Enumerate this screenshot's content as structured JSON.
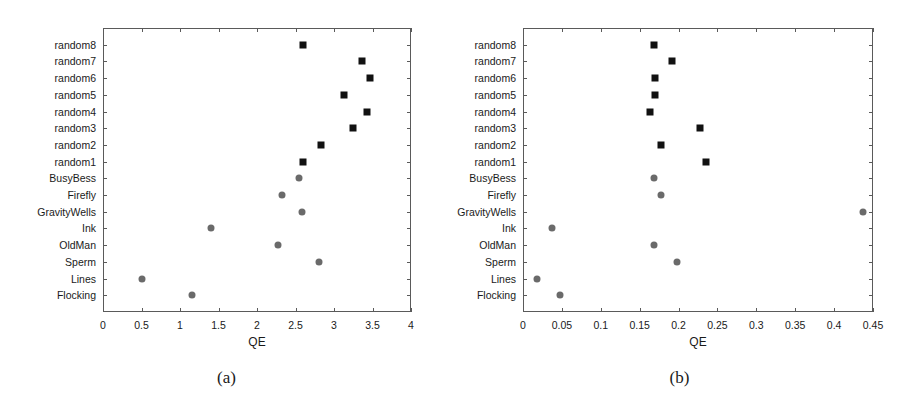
{
  "figure": {
    "panels": [
      {
        "id": "a",
        "caption": "(a)",
        "chart_data": {
          "type": "scatter",
          "title": "",
          "xlabel": "QE",
          "ylabel": "",
          "xlim": [
            0,
            4
          ],
          "xticks": [
            0,
            0.5,
            1,
            1.5,
            2,
            2.5,
            3,
            3.5,
            4
          ],
          "xtick_labels": [
            "0",
            "0.5",
            "1",
            "1.5",
            "2",
            "2.5",
            "3",
            "3.5",
            "4"
          ],
          "grid": false,
          "legend_position": "none",
          "categories": [
            "random8",
            "random7",
            "random6",
            "random5",
            "random4",
            "random3",
            "random2",
            "random1",
            "BusyBess",
            "Firefly",
            "GravityWells",
            "Ink",
            "OldMan",
            "Sperm",
            "Lines",
            "Flocking"
          ],
          "series": [
            {
              "name": "random",
              "marker": "square",
              "color": "#111111",
              "points": [
                {
                  "category": "random8",
                  "value": 2.6
                },
                {
                  "category": "random7",
                  "value": 3.37
                },
                {
                  "category": "random6",
                  "value": 3.47
                },
                {
                  "category": "random5",
                  "value": 3.13
                },
                {
                  "category": "random4",
                  "value": 3.43
                },
                {
                  "category": "random3",
                  "value": 3.25
                },
                {
                  "category": "random2",
                  "value": 2.83
                },
                {
                  "category": "random1",
                  "value": 2.6
                }
              ]
            },
            {
              "name": "named",
              "marker": "circle",
              "color": "#6a6a6a",
              "points": [
                {
                  "category": "BusyBess",
                  "value": 2.55
                },
                {
                  "category": "Firefly",
                  "value": 2.33
                },
                {
                  "category": "GravityWells",
                  "value": 2.58
                },
                {
                  "category": "Ink",
                  "value": 1.4
                },
                {
                  "category": "OldMan",
                  "value": 2.27
                },
                {
                  "category": "Sperm",
                  "value": 2.8
                },
                {
                  "category": "Lines",
                  "value": 0.5
                },
                {
                  "category": "Flocking",
                  "value": 1.15
                }
              ]
            }
          ]
        }
      },
      {
        "id": "b",
        "caption": "(b)",
        "chart_data": {
          "type": "scatter",
          "title": "",
          "xlabel": "QE",
          "ylabel": "",
          "xlim": [
            0,
            0.45
          ],
          "xticks": [
            0,
            0.05,
            0.1,
            0.15,
            0.2,
            0.25,
            0.3,
            0.35,
            0.4,
            0.45
          ],
          "xtick_labels": [
            "0",
            "0.05",
            "0.1",
            "0.15",
            "0.2",
            "0.25",
            "0.3",
            "0.35",
            "0.4",
            "0.45"
          ],
          "grid": false,
          "legend_position": "none",
          "categories": [
            "random8",
            "random7",
            "random6",
            "random5",
            "random4",
            "random3",
            "random2",
            "random1",
            "BusyBess",
            "Firefly",
            "GravityWells",
            "Ink",
            "OldMan",
            "Sperm",
            "Lines",
            "Flocking"
          ],
          "series": [
            {
              "name": "random",
              "marker": "square",
              "color": "#111111",
              "points": [
                {
                  "category": "random8",
                  "value": 0.168
                },
                {
                  "category": "random7",
                  "value": 0.192
                },
                {
                  "category": "random6",
                  "value": 0.17
                },
                {
                  "category": "random5",
                  "value": 0.17
                },
                {
                  "category": "random4",
                  "value": 0.163
                },
                {
                  "category": "random3",
                  "value": 0.228
                },
                {
                  "category": "random2",
                  "value": 0.178
                },
                {
                  "category": "random1",
                  "value": 0.235
                }
              ]
            },
            {
              "name": "named",
              "marker": "circle",
              "color": "#6a6a6a",
              "points": [
                {
                  "category": "BusyBess",
                  "value": 0.168
                },
                {
                  "category": "Firefly",
                  "value": 0.178
                },
                {
                  "category": "GravityWells",
                  "value": 0.437
                },
                {
                  "category": "Ink",
                  "value": 0.037
                },
                {
                  "category": "OldMan",
                  "value": 0.168
                },
                {
                  "category": "Sperm",
                  "value": 0.198
                },
                {
                  "category": "Lines",
                  "value": 0.018
                },
                {
                  "category": "Flocking",
                  "value": 0.048
                }
              ]
            }
          ]
        }
      }
    ]
  }
}
